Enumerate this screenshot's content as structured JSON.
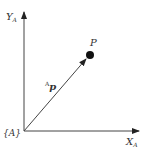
{
  "diagram": {
    "frame_label": "{A}",
    "x_axis": {
      "label": "X",
      "subscript": "A"
    },
    "y_axis": {
      "label": "Y",
      "subscript": "A"
    },
    "point": {
      "label": "P"
    },
    "vector": {
      "superscript": "A",
      "label": "p"
    },
    "colors": {
      "stroke": "#333333",
      "point": "#111111"
    }
  }
}
